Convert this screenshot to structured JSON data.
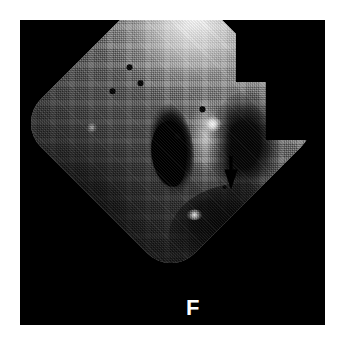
{
  "figure": {
    "kind": "endoscopic-photograph",
    "modality": "fiberoptic endoscopy",
    "panel_background": "#000000",
    "page_background": "#ffffff",
    "panel": {
      "x": 20,
      "y": 20,
      "width": 305,
      "height": 305
    }
  },
  "labels": {
    "panel_letter": "F"
  },
  "annotations": {
    "arrow": {
      "name": "pointer-arrow",
      "direction": "down",
      "color": "#000000",
      "tip_x": 211,
      "tip_y": 170,
      "points_at": "bright-focal-lesion"
    }
  },
  "field_of_view": {
    "shape": "rounded-diamond",
    "rotation_deg": 45,
    "corner_radius_px": 34,
    "notch_side": "right",
    "illumination": {
      "bright_corner": "upper-right",
      "dark_corner": "lower-left",
      "highlight_hex": "#ffffff",
      "midtone_hex": "#8d8d8d",
      "shadow_hex": "#0b0b0b"
    },
    "texture": "fiber-bundle-honeycomb"
  },
  "features": [
    {
      "name": "dark-opening-left",
      "hex": "#000000",
      "shape": "crescent"
    },
    {
      "name": "dark-opening-right",
      "hex": "#000000",
      "shape": "soft-ellipse"
    },
    {
      "name": "central-ridge",
      "hex": "#c8c8c8",
      "shape": "vertical-fold"
    },
    {
      "name": "specular-highlight-main",
      "hex": "#ffffff"
    },
    {
      "name": "specular-highlight-lower",
      "hex": "#ffffff"
    }
  ],
  "dead_fiber_dots": [
    {
      "x": 111,
      "y": 96,
      "r": 3.0
    },
    {
      "x": 122,
      "y": 112,
      "r": 2.6
    },
    {
      "x": 94,
      "y": 120,
      "r": 2.8
    },
    {
      "x": 184,
      "y": 138,
      "r": 2.6
    },
    {
      "x": 159,
      "y": 165,
      "r": 2.6
    },
    {
      "x": 233,
      "y": 172,
      "r": 2.0
    },
    {
      "x": 206,
      "y": 216,
      "r": 2.0
    }
  ]
}
